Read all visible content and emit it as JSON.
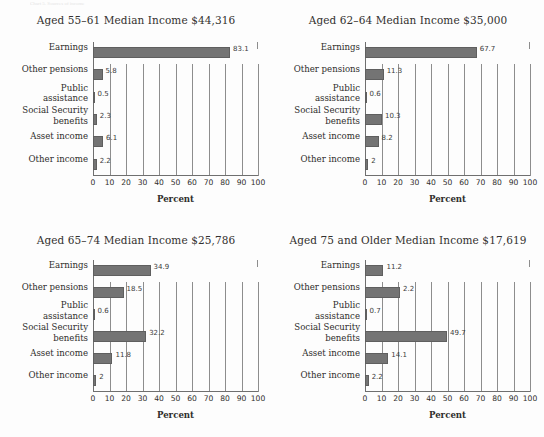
{
  "figure": {
    "top_cut_caption": "Chart 5. Sources of income",
    "background": "#fdfdfd",
    "bar_color": "#747474",
    "grid_color": "#8d8d8d",
    "axis_title": "Percent",
    "categories": [
      "Earnings",
      "Other pensions",
      "Public assistance",
      "Social Security benefits",
      "Asset income",
      "Other income"
    ],
    "xticks": [
      "0",
      "10",
      "20",
      "30",
      "40",
      "50",
      "60",
      "70",
      "80",
      "90",
      "100"
    ]
  },
  "chart_data": [
    {
      "type": "bar",
      "orientation": "horizontal",
      "title": "Aged 55–61 Median Income $44,316",
      "xlabel": "Percent",
      "ylabel": "",
      "xlim": [
        0,
        100
      ],
      "grid": true,
      "legend": "none",
      "categories": [
        "Earnings",
        "Other pensions",
        "Public assistance",
        "Social Security benefits",
        "Asset income",
        "Other income"
      ],
      "values": [
        83.1,
        5.8,
        0.5,
        2.3,
        6.1,
        2.2
      ],
      "labels": [
        "83.1",
        "5.8",
        "0.5",
        "2.3",
        "6.1",
        "2.2"
      ]
    },
    {
      "type": "bar",
      "orientation": "horizontal",
      "title": "Aged 62–64 Median Income $35,000",
      "xlabel": "Percent",
      "ylabel": "",
      "xlim": [
        0,
        100
      ],
      "grid": true,
      "legend": "none",
      "categories": [
        "Earnings",
        "Other pensions",
        "Public assistance",
        "Social Security benefits",
        "Asset income",
        "Other income"
      ],
      "values": [
        67.7,
        11.3,
        0.6,
        10.3,
        8.2,
        2
      ],
      "labels": [
        "67.7",
        "11.3",
        "0.6",
        "10.3",
        "8.2",
        "2"
      ]
    },
    {
      "type": "bar",
      "orientation": "horizontal",
      "title": "Aged 65–74 Median Income $25,786",
      "xlabel": "Percent",
      "ylabel": "",
      "xlim": [
        0,
        100
      ],
      "grid": true,
      "legend": "none",
      "categories": [
        "Earnings",
        "Other pensions",
        "Public assistance",
        "Social Security benefits",
        "Asset income",
        "Other income"
      ],
      "values": [
        34.9,
        18.5,
        0.6,
        32.2,
        11.8,
        2
      ],
      "labels": [
        "34.9",
        "18.5",
        "0.6",
        "32.2",
        "11.8",
        "2"
      ]
    },
    {
      "type": "bar",
      "orientation": "horizontal",
      "title": "Aged 75 and Older Median Income $17,619",
      "xlabel": "Percent",
      "ylabel": "",
      "xlim": [
        0,
        100
      ],
      "grid": true,
      "legend": "none",
      "categories": [
        "Earnings",
        "Other pensions",
        "Public assistance",
        "Social Security benefits",
        "Asset income",
        "Other income"
      ],
      "values": [
        11.2,
        21.2,
        0.7,
        49.7,
        14.1,
        2.2
      ],
      "labels": [
        "11.2",
        "2.2",
        "0.7",
        "49.7",
        "14.1",
        "2.2"
      ]
    }
  ]
}
